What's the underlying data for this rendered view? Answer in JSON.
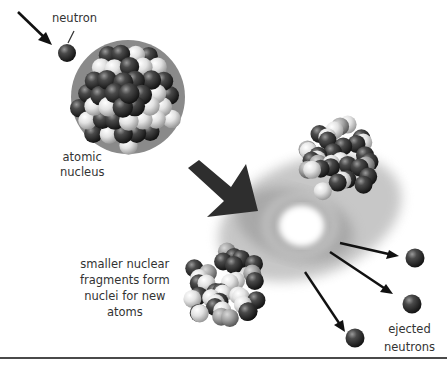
{
  "diagram": {
    "labels": {
      "neutron": "neutron",
      "nucleus_line1": "atomic",
      "nucleus_line2": "nucleus",
      "fragments_line1": "smaller nuclear",
      "fragments_line2": "fragments form",
      "fragments_line3": "nuclei for new",
      "fragments_line4": "atoms",
      "ejected_line1": "ejected",
      "ejected_line2": "neutrons"
    },
    "colors": {
      "dark_nucleon": "#3a3a3a",
      "light_nucleon": "#e6e6e6",
      "arrow": "#111111",
      "big_arrow": "#2e2e2e",
      "text": "#333333",
      "rule": "#4a4a4a"
    },
    "elements": [
      {
        "id": "incoming-neutron",
        "type": "neutron"
      },
      {
        "id": "atomic-nucleus",
        "type": "nucleus"
      },
      {
        "id": "fission-flash",
        "type": "burst"
      },
      {
        "id": "fragment-upper-right",
        "type": "nucleus-fragment"
      },
      {
        "id": "fragment-lower-left",
        "type": "nucleus-fragment"
      },
      {
        "id": "ejected-neutron-1",
        "type": "neutron"
      },
      {
        "id": "ejected-neutron-2",
        "type": "neutron"
      },
      {
        "id": "ejected-neutron-3",
        "type": "neutron"
      }
    ]
  }
}
